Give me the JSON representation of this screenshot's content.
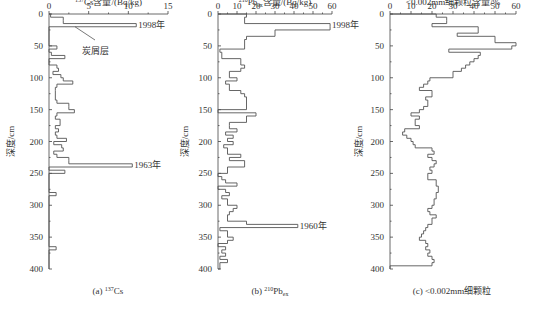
{
  "figure": {
    "ylabel": "深度/cm",
    "yticks": [
      0,
      50,
      100,
      150,
      200,
      250,
      300,
      350,
      400
    ]
  },
  "panels": [
    {
      "caption_prefix": "(a) ",
      "caption_sup": "137",
      "caption_main": "Cs",
      "caption_sub": "",
      "title_sup": "137",
      "title_main": "Cs含量/(Bq/kg)",
      "title_sub": "",
      "title_tail": "",
      "annotations": [
        {
          "text": "1998年"
        },
        {
          "text": "炭屑层"
        },
        {
          "text": "1963年"
        }
      ]
    },
    {
      "caption_prefix": "(b) ",
      "caption_sup": "210",
      "caption_main": "Pb",
      "caption_sub": "ex",
      "title_sup": "210",
      "title_main": "Pb",
      "title_sub": "ex",
      "title_tail": "含量/(Bq/kg)",
      "annotations": [
        {
          "text": "1998年"
        },
        {
          "text": "1960年"
        }
      ]
    },
    {
      "caption_prefix": "(c) ",
      "caption_sup": "",
      "caption_main": "<0.002mm细颗粒",
      "caption_sub": "",
      "title_sup": "",
      "title_main": "<0.002mm细颗粒含量/%",
      "title_sub": "",
      "title_tail": "",
      "annotations": []
    }
  ],
  "chart_data": [
    {
      "type": "step",
      "title": "137Cs含量/(Bq/kg)",
      "xlabel": "137Cs含量/(Bq/kg)",
      "ylabel": "深度/cm",
      "xlim": [
        0,
        15
      ],
      "ylim": [
        400,
        0
      ],
      "xticks": [
        0,
        5,
        10,
        15
      ],
      "yticks": [
        0,
        50,
        100,
        150,
        200,
        250,
        300,
        350,
        400
      ],
      "caption": "(a) 137Cs",
      "depth_intervals": [
        [
          0,
          5
        ],
        [
          5,
          10
        ],
        [
          10,
          15
        ],
        [
          15,
          20
        ],
        [
          20,
          45
        ],
        [
          45,
          50
        ],
        [
          50,
          55
        ],
        [
          55,
          60
        ],
        [
          60,
          65
        ],
        [
          65,
          70
        ],
        [
          70,
          80
        ],
        [
          80,
          85
        ],
        [
          85,
          90
        ],
        [
          90,
          95
        ],
        [
          95,
          100
        ],
        [
          100,
          105
        ],
        [
          105,
          110
        ],
        [
          110,
          115
        ],
        [
          115,
          120
        ],
        [
          120,
          135
        ],
        [
          135,
          140
        ],
        [
          140,
          145
        ],
        [
          145,
          150
        ],
        [
          150,
          155
        ],
        [
          155,
          160
        ],
        [
          160,
          165
        ],
        [
          165,
          175
        ],
        [
          175,
          180
        ],
        [
          180,
          185
        ],
        [
          185,
          190
        ],
        [
          190,
          195
        ],
        [
          195,
          200
        ],
        [
          200,
          205
        ],
        [
          205,
          210
        ],
        [
          210,
          215
        ],
        [
          215,
          220
        ],
        [
          220,
          225
        ],
        [
          225,
          230
        ],
        [
          230,
          235
        ],
        [
          235,
          240
        ],
        [
          240,
          245
        ],
        [
          245,
          250
        ],
        [
          250,
          280
        ],
        [
          280,
          285
        ],
        [
          285,
          290
        ],
        [
          290,
          365
        ],
        [
          365,
          370
        ],
        [
          370,
          375
        ],
        [
          375,
          400
        ]
      ],
      "values": [
        0.2,
        1.8,
        1.8,
        11,
        0,
        0,
        1,
        0,
        0.3,
        2,
        0,
        1,
        1.2,
        0.5,
        1.5,
        1.8,
        3,
        1,
        0.8,
        0.8,
        1,
        2.5,
        2.5,
        3.2,
        1,
        0.8,
        1.4,
        0.8,
        1.2,
        0.8,
        1,
        2.2,
        0.6,
        1.6,
        1.8,
        0.6,
        1,
        2.5,
        2.5,
        10.5,
        0,
        2,
        0,
        0.9,
        0,
        0,
        0.9,
        0,
        0
      ],
      "annotations": [
        {
          "text": "1998年",
          "depth": 17,
          "value": 11
        },
        {
          "text": "炭屑层",
          "depth": 20,
          "note": "leader line to 20cm layer"
        },
        {
          "text": "1963年",
          "depth": 237,
          "value": 10.5
        }
      ]
    },
    {
      "type": "step",
      "title": "210Pbex含量/(Bq/kg)",
      "xlabel": "210Pbex含量/(Bq/kg)",
      "ylabel": "深度/cm",
      "xlim": [
        0,
        60
      ],
      "ylim": [
        400,
        0
      ],
      "xticks": [
        0,
        10,
        20,
        30,
        40,
        50,
        60
      ],
      "yticks": [
        0,
        50,
        100,
        150,
        200,
        250,
        300,
        350,
        400
      ],
      "caption": "(b) 210Pbex",
      "depth_intervals": [
        [
          0,
          5
        ],
        [
          5,
          15
        ],
        [
          15,
          20
        ],
        [
          20,
          25
        ],
        [
          25,
          35
        ],
        [
          35,
          40
        ],
        [
          40,
          55
        ],
        [
          55,
          60
        ],
        [
          60,
          70
        ],
        [
          70,
          80
        ],
        [
          80,
          85
        ],
        [
          85,
          90
        ],
        [
          90,
          100
        ],
        [
          100,
          105
        ],
        [
          105,
          110
        ],
        [
          110,
          120
        ],
        [
          120,
          125
        ],
        [
          125,
          130
        ],
        [
          130,
          150
        ],
        [
          150,
          155
        ],
        [
          155,
          160
        ],
        [
          160,
          170
        ],
        [
          170,
          175
        ],
        [
          175,
          180
        ],
        [
          180,
          185
        ],
        [
          185,
          190
        ],
        [
          190,
          195
        ],
        [
          195,
          200
        ],
        [
          200,
          205
        ],
        [
          205,
          210
        ],
        [
          210,
          220
        ],
        [
          220,
          225
        ],
        [
          225,
          230
        ],
        [
          230,
          240
        ],
        [
          240,
          250
        ],
        [
          250,
          255
        ],
        [
          255,
          260
        ],
        [
          260,
          265
        ],
        [
          265,
          270
        ],
        [
          270,
          275
        ],
        [
          275,
          280
        ],
        [
          280,
          285
        ],
        [
          285,
          290
        ],
        [
          290,
          300
        ],
        [
          300,
          305
        ],
        [
          305,
          310
        ],
        [
          310,
          315
        ],
        [
          315,
          325
        ],
        [
          325,
          330
        ],
        [
          330,
          335
        ],
        [
          335,
          340
        ],
        [
          340,
          350
        ],
        [
          350,
          355
        ],
        [
          355,
          360
        ],
        [
          360,
          365
        ],
        [
          365,
          370
        ],
        [
          370,
          375
        ],
        [
          375,
          380
        ],
        [
          380,
          385
        ],
        [
          385,
          390
        ],
        [
          390,
          400
        ]
      ],
      "values": [
        15,
        14,
        59,
        59,
        30,
        15,
        14,
        1,
        2,
        12,
        14,
        12,
        6,
        10,
        4,
        6,
        12,
        14,
        15,
        0,
        20,
        15,
        6,
        6,
        10,
        4,
        8,
        5,
        8,
        3,
        5,
        12,
        6,
        14,
        5,
        0,
        2,
        4,
        10,
        0,
        4,
        6,
        2,
        5,
        10,
        8,
        6,
        5,
        15,
        42,
        1,
        5,
        8,
        5,
        0,
        4,
        2,
        4,
        1,
        5,
        1
      ],
      "annotations": [
        {
          "text": "1998年",
          "depth": 17,
          "value": 59
        },
        {
          "text": "1960年",
          "depth": 333,
          "value": 42
        }
      ]
    },
    {
      "type": "step",
      "title": "<0.002mm细颗粒含量/%",
      "xlabel": "<0.002mm细颗粒含量/%",
      "ylabel": "深度/cm",
      "xlim": [
        0,
        60
      ],
      "ylim": [
        400,
        0
      ],
      "xticks": [
        0,
        10,
        20,
        30,
        40,
        50,
        60
      ],
      "yticks": [
        0,
        50,
        100,
        150,
        200,
        250,
        300,
        350,
        400
      ],
      "caption": "(c) <0.002mm细颗粒",
      "depth_intervals": [
        [
          0,
          5
        ],
        [
          5,
          10
        ],
        [
          10,
          15
        ],
        [
          15,
          20
        ],
        [
          20,
          30
        ],
        [
          30,
          35
        ],
        [
          35,
          45
        ],
        [
          45,
          50
        ],
        [
          50,
          55
        ],
        [
          55,
          60
        ],
        [
          60,
          65
        ],
        [
          65,
          70
        ],
        [
          70,
          75
        ],
        [
          75,
          80
        ],
        [
          80,
          85
        ],
        [
          85,
          90
        ],
        [
          90,
          100
        ],
        [
          100,
          105
        ],
        [
          105,
          110
        ],
        [
          110,
          115
        ],
        [
          115,
          120
        ],
        [
          120,
          130
        ],
        [
          130,
          135
        ],
        [
          135,
          145
        ],
        [
          145,
          150
        ],
        [
          150,
          155
        ],
        [
          155,
          160
        ],
        [
          160,
          165
        ],
        [
          165,
          175
        ],
        [
          175,
          180
        ],
        [
          180,
          185
        ],
        [
          185,
          190
        ],
        [
          190,
          195
        ],
        [
          195,
          200
        ],
        [
          200,
          205
        ],
        [
          205,
          210
        ],
        [
          210,
          215
        ],
        [
          215,
          220
        ],
        [
          220,
          225
        ],
        [
          225,
          230
        ],
        [
          230,
          235
        ],
        [
          235,
          240
        ],
        [
          240,
          245
        ],
        [
          245,
          250
        ],
        [
          250,
          260
        ],
        [
          260,
          270
        ],
        [
          270,
          280
        ],
        [
          280,
          290
        ],
        [
          290,
          300
        ],
        [
          300,
          305
        ],
        [
          305,
          310
        ],
        [
          310,
          315
        ],
        [
          315,
          320
        ],
        [
          320,
          330
        ],
        [
          330,
          335
        ],
        [
          335,
          340
        ],
        [
          340,
          345
        ],
        [
          345,
          350
        ],
        [
          350,
          355
        ],
        [
          355,
          360
        ],
        [
          360,
          365
        ],
        [
          365,
          370
        ],
        [
          370,
          375
        ],
        [
          375,
          380
        ],
        [
          380,
          385
        ],
        [
          385,
          390
        ],
        [
          390,
          395
        ],
        [
          395,
          400
        ]
      ],
      "values": [
        22,
        27,
        27,
        20,
        42,
        32,
        50,
        60,
        58,
        28,
        43,
        42,
        40,
        38,
        36,
        34,
        30,
        19,
        18,
        16,
        14,
        20,
        17,
        18,
        16,
        14,
        10,
        14,
        12,
        14,
        7,
        6,
        8,
        10,
        11,
        12,
        20,
        21,
        18,
        20,
        22,
        21,
        19,
        20,
        18,
        22,
        23,
        22,
        21,
        20,
        18,
        19,
        22,
        20,
        18,
        17,
        16,
        15,
        14,
        17,
        18,
        17,
        19,
        18,
        20,
        21,
        20,
        0
      ],
      "annotations": []
    }
  ]
}
